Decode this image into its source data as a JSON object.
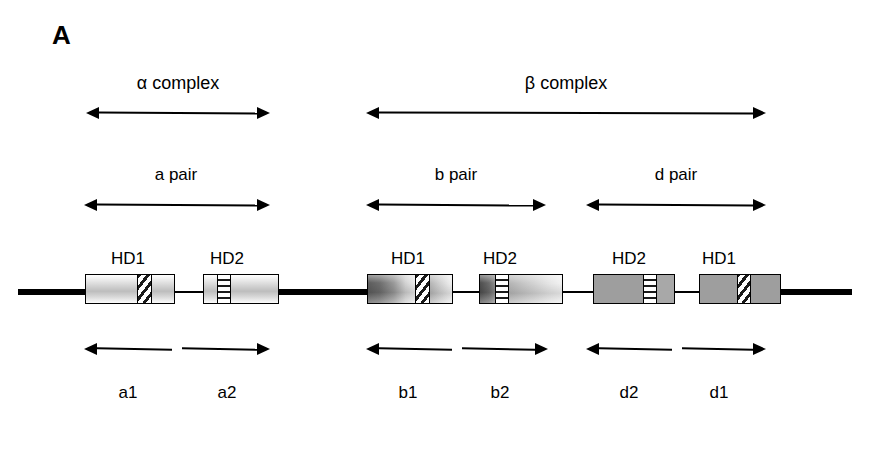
{
  "figure": {
    "panel_letter": "A",
    "background_color": "#ffffff",
    "line_color": "#000000"
  },
  "complexes": [
    {
      "id": "alpha",
      "label": "α complex",
      "label_x": 178,
      "label_y": 74,
      "arrow_x": 86,
      "arrow_y": 106,
      "arrow_w": 184
    },
    {
      "id": "beta",
      "label": "β complex",
      "label_x": 566,
      "label_y": 74,
      "arrow_x": 366,
      "arrow_y": 106,
      "arrow_w": 400
    }
  ],
  "pairs": [
    {
      "id": "a",
      "label": "a pair",
      "label_x": 176,
      "label_y": 166,
      "arrow_x": 84,
      "arrow_y": 198,
      "arrow_w": 186
    },
    {
      "id": "b",
      "label": "b pair",
      "label_x": 456,
      "label_y": 166,
      "arrow_x": 366,
      "arrow_y": 198,
      "arrow_w": 180
    },
    {
      "id": "d",
      "label": "d pair",
      "label_x": 676,
      "label_y": 166,
      "arrow_x": 586,
      "arrow_y": 198,
      "arrow_w": 180
    }
  ],
  "domain_labels": [
    {
      "text": "HD1",
      "x": 128,
      "y": 250
    },
    {
      "text": "HD2",
      "x": 227,
      "y": 250
    },
    {
      "text": "HD1",
      "x": 408,
      "y": 250
    },
    {
      "text": "HD2",
      "x": 500,
      "y": 250
    },
    {
      "text": "HD2",
      "x": 629,
      "y": 250
    },
    {
      "text": "HD1",
      "x": 719,
      "y": 250
    }
  ],
  "half_arrows": [
    {
      "id": "a1",
      "direction": "left",
      "x": 84,
      "y": 342,
      "w": 88
    },
    {
      "id": "a2",
      "direction": "right",
      "x": 182,
      "y": 342,
      "w": 88
    },
    {
      "id": "b1",
      "direction": "left",
      "x": 366,
      "y": 342,
      "w": 86
    },
    {
      "id": "b2",
      "direction": "right",
      "x": 462,
      "y": 342,
      "w": 86
    },
    {
      "id": "d1",
      "direction": "left",
      "x": 586,
      "y": 342,
      "w": 86
    },
    {
      "id": "d2",
      "direction": "right",
      "x": 682,
      "y": 342,
      "w": 84
    }
  ],
  "segment_labels": [
    {
      "text": "a1",
      "x": 128,
      "y": 384
    },
    {
      "text": "a2",
      "x": 227,
      "y": 384
    },
    {
      "text": "b1",
      "x": 408,
      "y": 384
    },
    {
      "text": "b2",
      "x": 500,
      "y": 384
    },
    {
      "text": "d2",
      "x": 629,
      "y": 384
    },
    {
      "text": "d1",
      "x": 719,
      "y": 384
    }
  ],
  "backbone": {
    "y": 289,
    "segments": [
      {
        "kind": "thick",
        "x": 18,
        "w": 68
      },
      {
        "kind": "thin",
        "x": 174,
        "w": 30
      },
      {
        "kind": "thick",
        "x": 278,
        "w": 90
      },
      {
        "kind": "thin",
        "x": 452,
        "w": 28
      },
      {
        "kind": "thin",
        "x": 562,
        "w": 32
      },
      {
        "kind": "thin",
        "x": 674,
        "w": 26
      },
      {
        "kind": "thick",
        "x": 760,
        "w": 92
      }
    ]
  },
  "domain_boxes": [
    {
      "id": "a-hd1",
      "x": 85,
      "y": 274,
      "w": 90,
      "h": 30,
      "segments": [
        {
          "fill": "fill-light",
          "w": 52,
          "divider": "right"
        },
        {
          "fill": "hatch-diag",
          "w": 14,
          "divider": "right"
        },
        {
          "fill": "fill-light",
          "w": 24,
          "divider": "none"
        }
      ]
    },
    {
      "id": "a-hd2",
      "x": 203,
      "y": 274,
      "w": 76,
      "h": 30,
      "segments": [
        {
          "fill": "fill-light",
          "w": 14,
          "divider": "right"
        },
        {
          "fill": "hatch-horz",
          "w": 13,
          "divider": "right"
        },
        {
          "fill": "fill-light",
          "w": 49,
          "divider": "none"
        }
      ]
    },
    {
      "id": "b-hd1",
      "x": 367,
      "y": 274,
      "w": 86,
      "h": 30,
      "segments": [
        {
          "fill": "fill-darkgrad",
          "w": 48,
          "divider": "right"
        },
        {
          "fill": "hatch-diag",
          "w": 14,
          "divider": "right"
        },
        {
          "fill": "fill-lightgrad-r",
          "w": 24,
          "divider": "none"
        }
      ]
    },
    {
      "id": "b-hd2",
      "x": 479,
      "y": 274,
      "w": 84,
      "h": 30,
      "segments": [
        {
          "fill": "fill-darkgrad-sm",
          "w": 16,
          "divider": "right"
        },
        {
          "fill": "hatch-horz",
          "w": 13,
          "divider": "right"
        },
        {
          "fill": "fill-lightgrad-r",
          "w": 55,
          "divider": "none"
        }
      ]
    },
    {
      "id": "d-hd2",
      "x": 593,
      "y": 274,
      "w": 82,
      "h": 30,
      "segments": [
        {
          "fill": "fill-flat",
          "w": 50,
          "divider": "right"
        },
        {
          "fill": "hatch-horz",
          "w": 13,
          "divider": "right"
        },
        {
          "fill": "fill-flat-light",
          "w": 19,
          "divider": "none"
        }
      ]
    },
    {
      "id": "d-hd1",
      "x": 699,
      "y": 274,
      "w": 82,
      "h": 30,
      "segments": [
        {
          "fill": "fill-flat",
          "w": 38,
          "divider": "right"
        },
        {
          "fill": "hatch-diag",
          "w": 13,
          "divider": "right"
        },
        {
          "fill": "fill-flat",
          "w": 31,
          "divider": "none"
        }
      ]
    }
  ]
}
